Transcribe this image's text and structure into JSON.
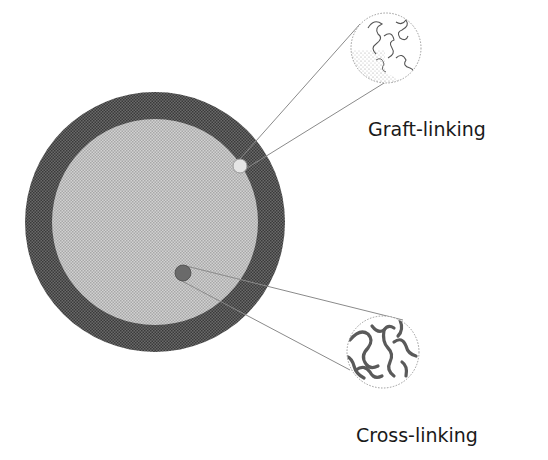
{
  "diagram": {
    "particle": {
      "shell_color": "#5e5e5e",
      "core_color": "#c4c4c4",
      "center": [
        155,
        222
      ],
      "outer_radius": 130,
      "inner_radius": 103
    },
    "callouts": [
      {
        "id": "graft",
        "label": "Graft-linking",
        "marker_center": [
          240,
          166
        ],
        "marker_radius": 7,
        "marker_color": "#e2e2e2",
        "inset_center": [
          386,
          48
        ],
        "inset_radius": 35,
        "label_pos": [
          368,
          136
        ]
      },
      {
        "id": "cross",
        "label": "Cross-linking",
        "marker_center": [
          183,
          273
        ],
        "marker_radius": 8,
        "marker_color": "#6a6a6a",
        "inset_center": [
          383,
          352
        ],
        "inset_radius": 36,
        "label_pos": [
          356,
          442
        ]
      }
    ]
  }
}
